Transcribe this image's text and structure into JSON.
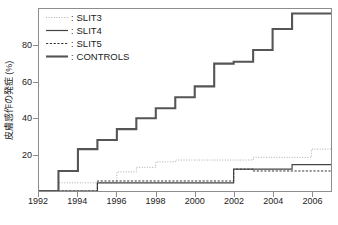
{
  "chart_data": {
    "type": "line",
    "title": "",
    "subtitle": "",
    "xlabel": "",
    "ylabel": "皮膚感作の発症 (%)",
    "xlim": [
      1992,
      2007
    ],
    "ylim": [
      0,
      100
    ],
    "grid": false,
    "step_style": "post",
    "legend_position": "top-left",
    "xticks": [
      "1992",
      "1994",
      "1996",
      "1998",
      "2000",
      "2002",
      "2004",
      "2006"
    ],
    "xtick_values": [
      1992,
      1994,
      1996,
      1998,
      2000,
      2002,
      2004,
      2006
    ],
    "yticks": [
      "20",
      "40",
      "60",
      "80"
    ],
    "ytick_values": [
      20,
      40,
      60,
      80
    ],
    "series": [
      {
        "name": "SLIT3",
        "legend_label": "SLIT3",
        "line_style": "dotted",
        "color": "#aaaaaa",
        "width": 1,
        "x": [
          1992,
          1993,
          1996,
          1997,
          1998,
          1999,
          2003,
          2006,
          2007
        ],
        "y": [
          0,
          4.5,
          10.5,
          13,
          16,
          17,
          18.5,
          23,
          23
        ]
      },
      {
        "name": "SLIT4",
        "legend_label": "SLIT4",
        "line_style": "solid",
        "color": "#444444",
        "width": 1.2,
        "x": [
          1992,
          1995,
          2002,
          2005,
          2007
        ],
        "y": [
          0,
          4.5,
          12,
          14.5,
          14.5
        ]
      },
      {
        "name": "SLIT5",
        "legend_label": "SLIT5",
        "line_style": "dashed",
        "color": "#333333",
        "width": 1,
        "x": [
          1992,
          1995,
          2002,
          2003,
          2007
        ],
        "y": [
          0,
          5.5,
          12,
          11,
          11
        ]
      },
      {
        "name": "CONTROLS",
        "legend_label": "CONTROLS",
        "line_style": "solid",
        "color": "#555555",
        "width": 2.1,
        "x": [
          1992,
          1993,
          1994,
          1995,
          1996,
          1997,
          1998,
          1999,
          2000,
          2001,
          2002,
          2003,
          2004,
          2005,
          2007
        ],
        "y": [
          0,
          11,
          23,
          28,
          34,
          40,
          45.5,
          51.5,
          57.5,
          70,
          71,
          77.5,
          89,
          97.5,
          97.5
        ]
      }
    ]
  },
  "legend": {
    "separator": ":",
    "items": [
      {
        "label": "SLIT3"
      },
      {
        "label": "SLIT4"
      },
      {
        "label": "SLIT5"
      },
      {
        "label": "CONTROLS"
      }
    ]
  },
  "colors": {
    "axis": "#8d8d8d",
    "text": "#222222",
    "background": "#ffffff"
  }
}
